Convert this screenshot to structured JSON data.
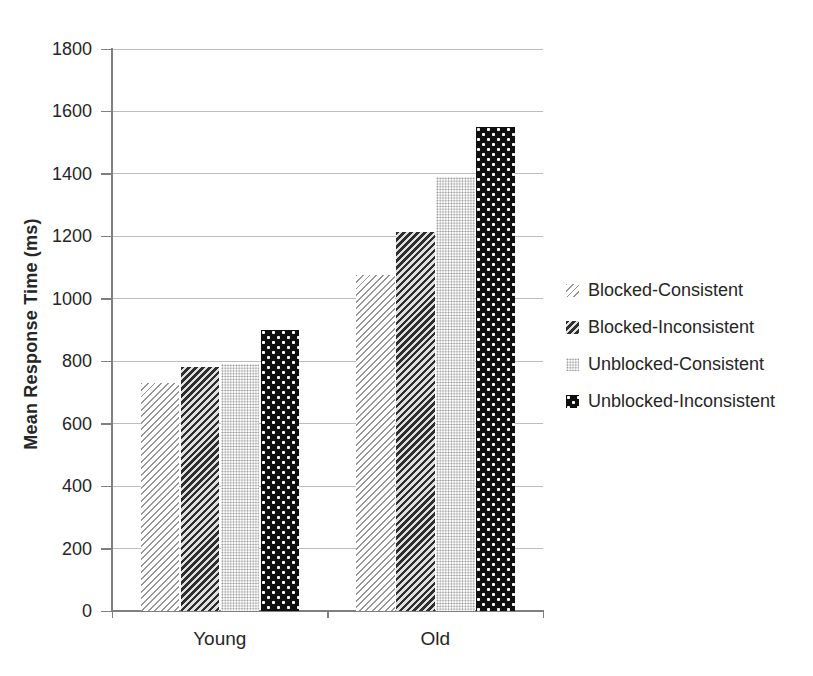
{
  "chart_data": {
    "type": "bar",
    "title": "",
    "ylabel": "Mean Response Time (ms)",
    "xlabel": "",
    "categories": [
      "Young",
      "Old"
    ],
    "series": [
      {
        "name": "Blocked-Consistent",
        "pattern": "light-diagonal-hatch",
        "values": [
          730,
          1075
        ]
      },
      {
        "name": "Blocked-Inconsistent",
        "pattern": "dark-diagonal-hatch",
        "values": [
          780,
          1215
        ]
      },
      {
        "name": "Unblocked-Consistent",
        "pattern": "gray-dot-grid",
        "values": [
          790,
          1390
        ]
      },
      {
        "name": "Unblocked-Inconsistent",
        "pattern": "black-white-dots",
        "values": [
          900,
          1550
        ]
      }
    ],
    "ylim": [
      0,
      1800
    ],
    "ytick_step": 200,
    "grid": true,
    "legend_position": "right"
  },
  "colors": {
    "text": "#262626",
    "gridline": "#bdbdbd",
    "axis": "#7f7f7f"
  }
}
